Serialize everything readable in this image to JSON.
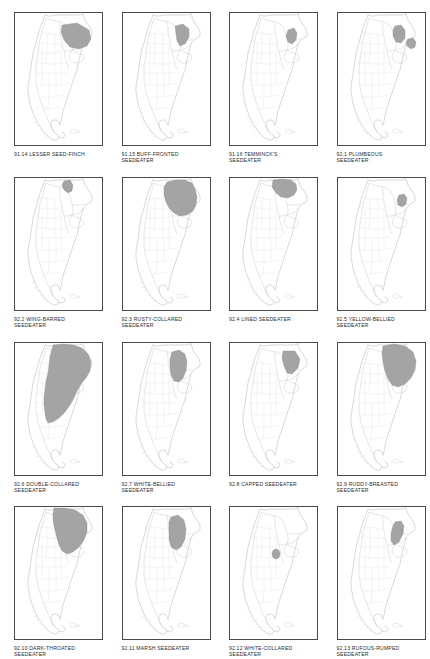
{
  "plate": {
    "title": "Seedeaters and Seed-Finches distribution maps",
    "columns": 4,
    "rows": 4,
    "region": "Southern South America",
    "range_fill_color": "#9c9c9c",
    "outline_color": "#c9c9c9",
    "panel_border_color": "#4a4a4a",
    "caption_color": "#2b2b2b"
  },
  "panels": [
    {
      "number": "91.14",
      "name": "LESSER SEED-FINCH",
      "caption": "91.14  LESSER SEED-FINCH",
      "range_style": "wedge-ne",
      "range_size": "medium"
    },
    {
      "number": "91.15",
      "name": "BUFF-FRONTED SEEDEATER",
      "caption": "91.15  BUFF-FRONTED\nSEEDEATER",
      "range_style": "narrow-ne",
      "range_size": "small"
    },
    {
      "number": "91.16",
      "name": "TEMMINCK'S SEEDEATER",
      "caption": "91.16  TEMMINCK'S\nSEEDEATER",
      "range_style": "tiny-ne",
      "range_size": "tiny"
    },
    {
      "number": "92.1",
      "name": "PLUMBEOUS SEEDEATER",
      "caption": "92.1  PLUMBEOUS\nSEEDEATER",
      "range_style": "two-blobs",
      "range_size": "small"
    },
    {
      "number": "92.2",
      "name": "WING-BARRED SEEDEATER",
      "caption": "92.2  WING-BARRED\nSEEDEATER",
      "range_style": "tiny-north",
      "range_size": "tiny"
    },
    {
      "number": "92.3",
      "name": "RUSTY-COLLARED SEEDEATER",
      "caption": "92.3  RUSTY-COLLARED\nSEEDEATER",
      "range_style": "broad-ne",
      "range_size": "large"
    },
    {
      "number": "92.4",
      "name": "LINED SEEDEATER",
      "caption": "92.4  LINED SEEDEATER",
      "range_style": "top-band",
      "range_size": "medium"
    },
    {
      "number": "92.5",
      "name": "YELLOW-BELLIED SEEDEATER",
      "caption": "92.5  YELLOW-BELLIED\nSEEDEATER",
      "range_style": "small-oval",
      "range_size": "tiny"
    },
    {
      "number": "92.6",
      "name": "DOUBLE-COLLARED SEEDEATER",
      "caption": "92.6  DOUBLE-COLLARED\nSEEDEATER",
      "range_style": "very-large",
      "range_size": "very-large"
    },
    {
      "number": "92.7",
      "name": "WHITE-BELLIED SEEDEATER",
      "caption": "92.7  WHITE-BELLIED\nSEEDEATER",
      "range_style": "vertical-ne",
      "range_size": "medium"
    },
    {
      "number": "92.8",
      "name": "CAPPED SEEDEATER",
      "caption": "92.8  CAPPED SEEDEATER",
      "range_style": "triangle-ne",
      "range_size": "small"
    },
    {
      "number": "92.9",
      "name": "RUDDY-BREASTED SEEDEATER",
      "caption": "92.9  RUDDY-BREASTED\nSEEDEATER",
      "range_style": "fan-ne",
      "range_size": "large"
    },
    {
      "number": "92.10",
      "name": "DARK-THROATED SEEDEATER",
      "caption": "92.10  DARK-THROATED\nSEEDEATER",
      "range_style": "broad-ne2",
      "range_size": "large"
    },
    {
      "number": "92.11",
      "name": "MARSH SEEDEATER",
      "caption": "92.11  MARSH SEEDEATER",
      "range_style": "vertical-strip",
      "range_size": "medium"
    },
    {
      "number": "92.12",
      "name": "WHITE-COLLARED SEEDEATER",
      "caption": "92.12  WHITE-COLLARED\nSEEDEATER",
      "range_style": "dot",
      "range_size": "dot"
    },
    {
      "number": "92.13",
      "name": "RUFOUS-RUMPED SEEDEATER",
      "caption": "92.13  RUFOUS-RUMPED\nSEEDEATER",
      "range_style": "lozenge",
      "range_size": "small"
    }
  ]
}
